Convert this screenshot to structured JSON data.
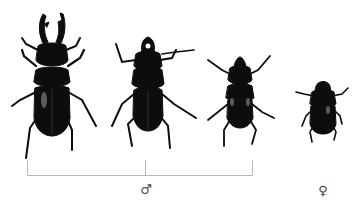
{
  "figure": {
    "specimens": [
      {
        "id": "male-major",
        "sex": "male",
        "size": "large"
      },
      {
        "id": "male-medium",
        "sex": "male",
        "size": "medium"
      },
      {
        "id": "male-minor",
        "sex": "male",
        "size": "small"
      },
      {
        "id": "female",
        "sex": "female",
        "size": "small"
      }
    ],
    "labels": {
      "male_symbol": "♂",
      "female_symbol": "♀"
    },
    "colors": {
      "beetle": "#0d0d0d",
      "highlight": "#5a5a5a",
      "bracket": "#b8b8b8",
      "background": "#ffffff"
    }
  }
}
